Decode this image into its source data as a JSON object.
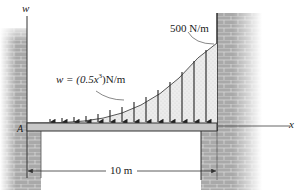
{
  "diagram": {
    "type": "distributed-load-beam",
    "axes": {
      "vertical_label": "w",
      "horizontal_label": "x"
    },
    "support_point_label": "A",
    "load": {
      "equation_prefix": "w = (0.5",
      "equation_var": "x",
      "equation_exp": "3",
      "equation_suffix": ")N/m",
      "max_value_label": "500 N/m",
      "shape": "cubic",
      "start_value": 0,
      "end_value": 500
    },
    "dimension": {
      "length_label": "10 m",
      "length_m": 10
    },
    "colors": {
      "beam_fill": "#c8c8c8",
      "load_fill": "#e6e6e6",
      "brick": "#9a9a9a",
      "line": "#2a2a2a"
    }
  }
}
